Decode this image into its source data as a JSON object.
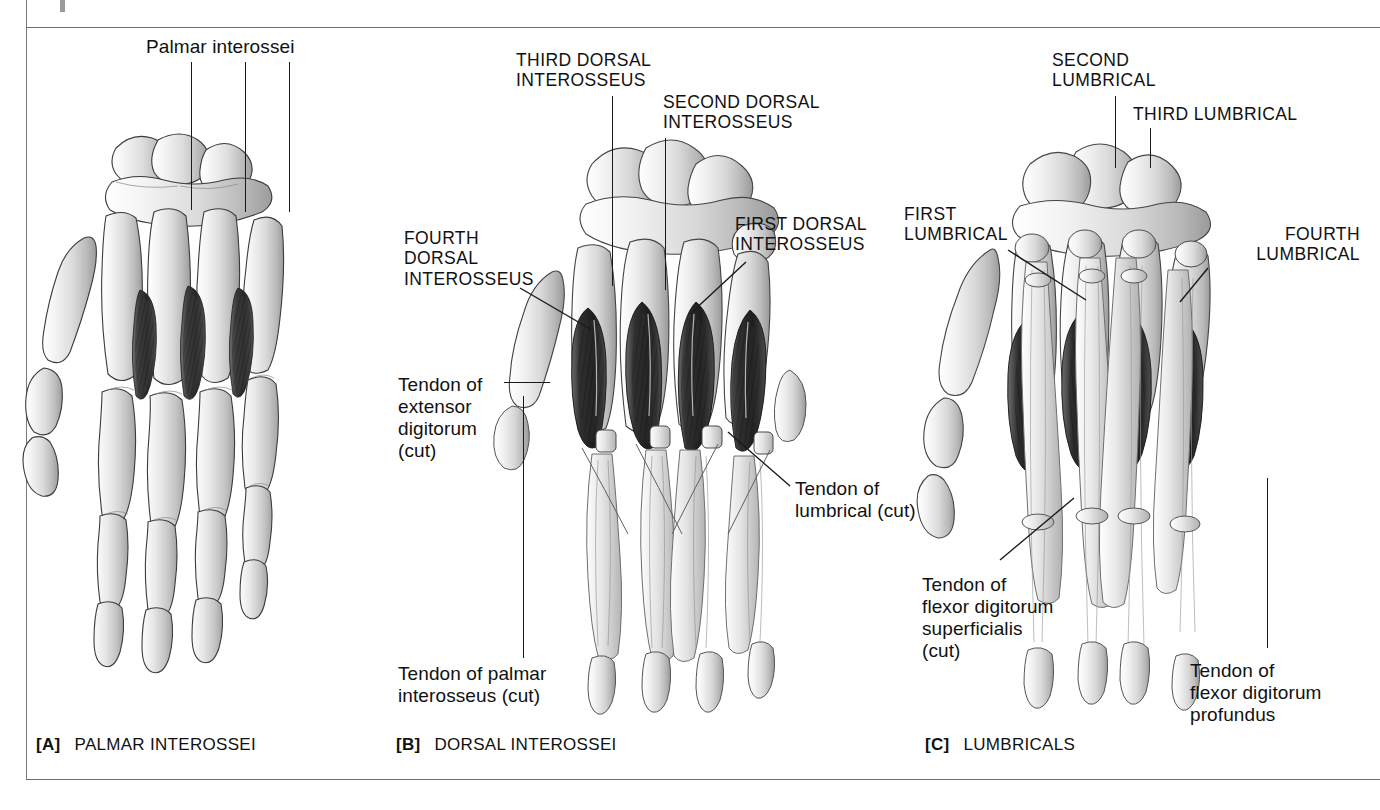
{
  "plate": {
    "title": "Intrinsic muscles of the hand",
    "background_color": "#ffffff",
    "ink_color": "#111111",
    "rule_color": "#6d6d6d"
  },
  "panels": [
    {
      "tag": "[A]",
      "caption": "PALMAR INTEROSSEI",
      "view": "palmar",
      "labels": [
        {
          "name": "palmar-interossei",
          "text": "Palmar  interossei",
          "style": "lower",
          "leaders": 3
        }
      ]
    },
    {
      "tag": "[B]",
      "caption": "DORSAL INTEROSSEI",
      "view": "dorsal",
      "labels": [
        {
          "name": "third-dorsal-interosseus",
          "text": "THIRD DORSAL\nINTEROSSEUS",
          "style": "caps"
        },
        {
          "name": "second-dorsal-interosseus",
          "text": "SECOND DORSAL\nINTEROSSEUS",
          "style": "caps"
        },
        {
          "name": "fourth-dorsal-interosseus",
          "text": "FOURTH\nDORSAL\nINTEROSSEUS",
          "style": "caps"
        },
        {
          "name": "first-dorsal-interosseus",
          "text": "FIRST DORSAL\nINTEROSSEUS",
          "style": "caps"
        },
        {
          "name": "tendon-of-extensor-digitorum-cut",
          "text": "Tendon of\nextensor\ndigitorum\n(cut)",
          "style": "lower"
        },
        {
          "name": "tendon-of-lumbrical-cut",
          "text": "Tendon of\nlumbrical (cut)",
          "style": "lower"
        },
        {
          "name": "tendon-of-palmar-interosseus-cut",
          "text": "Tendon of palmar\ninterosseus (cut)",
          "style": "lower"
        }
      ]
    },
    {
      "tag": "[C]",
      "caption": "LUMBRICALS",
      "view": "palmar-lumbricals",
      "labels": [
        {
          "name": "second-lumbrical",
          "text": "SECOND\nLUMBRICAL",
          "style": "caps"
        },
        {
          "name": "third-lumbrical",
          "text": "THIRD LUMBRICAL",
          "style": "caps"
        },
        {
          "name": "first-lumbrical",
          "text": "FIRST\nLUMBRICAL",
          "style": "caps"
        },
        {
          "name": "fourth-lumbrical",
          "text": "FOURTH\nLUMBRICAL",
          "style": "caps"
        },
        {
          "name": "tendon-of-flexor-digitorum-superficialis-cut",
          "text": "Tendon of\nflexor digitorum\nsuperficialis\n(cut)",
          "style": "lower"
        },
        {
          "name": "tendon-of-flexor-digitorum-profundus",
          "text": "Tendon of\nflexor digitorum\nprofundus",
          "style": "lower"
        }
      ]
    }
  ],
  "labels": {
    "palmar_interossei": "Palmar  interossei",
    "third_dorsal_interosseus": "THIRD DORSAL\nINTEROSSEUS",
    "second_dorsal_interosseus": "SECOND DORSAL\nINTEROSSEUS",
    "fourth_dorsal_interosseus": "FOURTH\nDORSAL\nINTEROSSEUS",
    "first_dorsal_interosseus": "FIRST DORSAL\nINTEROSSEUS",
    "tendon_of_extensor_digitorum_cut": "Tendon of\nextensor\ndigitorum\n(cut)",
    "tendon_of_lumbrical_cut": "Tendon of\nlumbrical (cut)",
    "tendon_of_palmar_interosseus_cut": "Tendon of palmar\ninterosseus (cut)",
    "second_lumbrical": "SECOND\nLUMBRICAL",
    "third_lumbrical": "THIRD LUMBRICAL",
    "first_lumbrical": "FIRST\nLUMBRICAL",
    "fourth_lumbrical": "FOURTH\nLUMBRICAL",
    "tendon_of_flexor_digitorum_superficialis_cut": "Tendon of\nflexor digitorum\nsuperficialis\n(cut)",
    "tendon_of_flexor_digitorum_profundus": "Tendon of\nflexor digitorum\nprofundus"
  },
  "captions": {
    "a_tag": "[A]",
    "a_text": "PALMAR INTEROSSEI",
    "b_tag": "[B]",
    "b_text": "DORSAL INTEROSSEI",
    "c_tag": "[C]",
    "c_text": "LUMBRICALS"
  }
}
